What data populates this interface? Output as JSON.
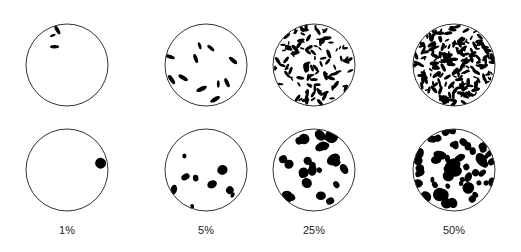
{
  "figure": {
    "title": "",
    "columns": [
      {
        "label": "1%",
        "coverage": 1,
        "cx": 67
      },
      {
        "label": "5%",
        "coverage": 5,
        "cx": 206
      },
      {
        "label": "25%",
        "coverage": 25,
        "cx": 314
      },
      {
        "label": "50%",
        "coverage": 50,
        "cx": 454
      }
    ],
    "rows": [
      {
        "pattern": "elongated specks",
        "cy": 65
      },
      {
        "pattern": "irregular blotches",
        "cy": 170
      }
    ],
    "radius": 41,
    "colors": {
      "ink": "#000000",
      "outline": "#333333",
      "background": "#ffffff"
    }
  }
}
